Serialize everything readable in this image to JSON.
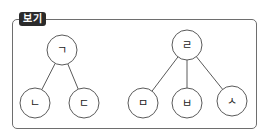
{
  "box": {
    "label": "보기"
  },
  "trees": [
    {
      "root": {
        "label": "ㄱ",
        "cx": 62,
        "cy": 50
      },
      "children": [
        {
          "label": "ㄴ",
          "cx": 35,
          "cy": 103
        },
        {
          "label": "ㄷ",
          "cx": 84,
          "cy": 103
        }
      ]
    },
    {
      "root": {
        "label": "ㄹ",
        "cx": 187,
        "cy": 45
      },
      "children": [
        {
          "label": "ㅁ",
          "cx": 143,
          "cy": 103
        },
        {
          "label": "ㅂ",
          "cx": 187,
          "cy": 103
        },
        {
          "label": "ㅅ",
          "cx": 232,
          "cy": 101
        }
      ]
    }
  ],
  "colors": {
    "stroke": "#5a5a5a",
    "label_bg": "#2b2b2b",
    "frame": "#6e6e6e"
  }
}
